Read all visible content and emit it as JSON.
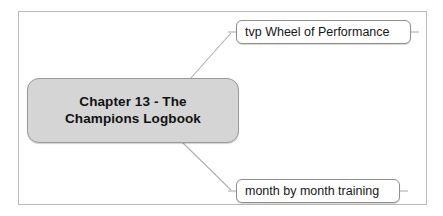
{
  "diagram": {
    "type": "mind-map",
    "frame": {
      "border_color": "#b9b9b9",
      "background": "#ffffff"
    },
    "root": {
      "label": "Chapter 13 - The\nChampions Logbook",
      "line1": "Chapter 13 - The",
      "line2": "Champions Logbook",
      "fill_color": "#d5d5d5",
      "border_color": "#9a9a9a",
      "text_color": "#111111"
    },
    "branches": [
      {
        "label": "tvp Wheel of Performance",
        "position": "top-right",
        "fill_color": "#ffffff",
        "border_color": "#8f8f8f",
        "text_color": "#161616"
      },
      {
        "label": "month by month training",
        "position": "bottom-right",
        "fill_color": "#ffffff",
        "border_color": "#8f8f8f",
        "text_color": "#161616"
      }
    ],
    "connector_color": "#b0b0b0"
  }
}
